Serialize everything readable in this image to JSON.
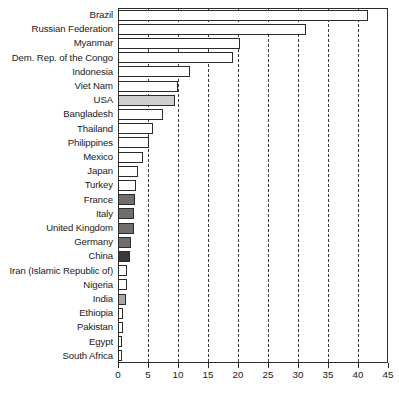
{
  "chart_data": {
    "type": "bar",
    "orientation": "horizontal",
    "title": "",
    "subtitle": "",
    "xlabel": "",
    "ylabel": "",
    "xlim": [
      0,
      45
    ],
    "ylim": null,
    "xticks": [
      0,
      5,
      10,
      15,
      20,
      25,
      30,
      35,
      40,
      45
    ],
    "xtick_labels": [
      "0",
      "5",
      "10",
      "15",
      "20",
      "25",
      "30",
      "35",
      "40",
      "45"
    ],
    "grid": "vertical-dashed",
    "legend": null,
    "legend_position": "none",
    "categories": [
      "Brazil",
      "Russian Federation",
      "Myanmar",
      "Dem. Rep. of the Congo",
      "Indonesia",
      "Viet Nam",
      "USA",
      "Bangladesh",
      "Thailand",
      "Philippines",
      "Mexico",
      "Japan",
      "Turkey",
      "France",
      "Italy",
      "United Kingdom",
      "Germany",
      "China",
      "Iran (Islamic Republic of)",
      "Nigeria",
      "India",
      "Ethiopia",
      "Pakistan",
      "Egypt",
      "South Africa"
    ],
    "values": [
      41.7,
      31.3,
      20.3,
      19.2,
      12.0,
      10.0,
      9.5,
      7.5,
      5.9,
      5.2,
      4.2,
      3.4,
      3.0,
      2.8,
      2.7,
      2.7,
      2.2,
      2.0,
      1.5,
      1.5,
      1.4,
      0.9,
      0.9,
      0.5,
      0.5
    ],
    "bar_fills": [
      "#ffffff",
      "#ffffff",
      "#ffffff",
      "#ffffff",
      "#ffffff",
      "#ffffff",
      "#cfcfcf",
      "#ffffff",
      "#ffffff",
      "#ffffff",
      "#ffffff",
      "#ffffff",
      "#ffffff",
      "#6e6e6e",
      "#6e6e6e",
      "#6e6e6e",
      "#6e6e6e",
      "#3a3a3a",
      "#ffffff",
      "#ffffff",
      "#a8a8a8",
      "#ffffff",
      "#ffffff",
      "#ffffff",
      "#ffffff"
    ]
  },
  "colors": {
    "axis": "#2b2b2b",
    "grid": "#3a3a3a",
    "background": "#ffffff",
    "text": "#1a1a1a"
  }
}
